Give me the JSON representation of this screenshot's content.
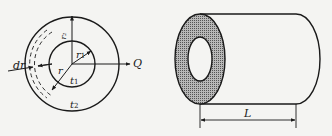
{
  "left_figure": {
    "description": "Cross-section of hollow cylinder (annulus) with radial heat flow",
    "labels": {
      "dr": "dr",
      "r": "r",
      "r1": "r",
      "r1_sub": "1",
      "t1": "t",
      "t1_sub": "1",
      "t2": "t",
      "t2_sub": "2",
      "heat_flow": "Q",
      "vertical_axis": "r₂"
    }
  },
  "right_figure": {
    "description": "Hollow cylinder of length L",
    "labels": {
      "length": "L"
    }
  },
  "colors": {
    "line": "#1a1a1a",
    "background": "#f4f4f2",
    "hatch": "#8a8a8a"
  }
}
